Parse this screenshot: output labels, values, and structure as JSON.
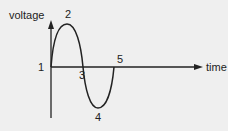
{
  "diagram": {
    "axes": {
      "y_label": "voltage",
      "x_label": "time"
    },
    "points": [
      {
        "label": "1",
        "meaning": "start, zero voltage"
      },
      {
        "label": "2",
        "meaning": "positive peak"
      },
      {
        "label": "3",
        "meaning": "zero crossing"
      },
      {
        "label": "4",
        "meaning": "negative peak"
      },
      {
        "label": "5",
        "meaning": "end of cycle, zero voltage"
      }
    ],
    "colors": {
      "background": "#efefef",
      "line": "#222222"
    }
  }
}
